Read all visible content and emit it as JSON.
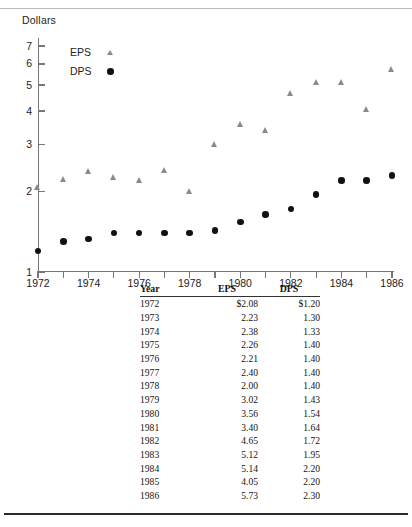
{
  "chart_data": {
    "type": "scatter",
    "title": "",
    "ylabel": "Dollars",
    "xlabel": "",
    "yscale": "log",
    "ylim": [
      1,
      7.5
    ],
    "xlim": [
      1972,
      1986
    ],
    "grid": false,
    "legend_position": "upper-left",
    "y_ticks": [
      1,
      2,
      3,
      4,
      5,
      6,
      7
    ],
    "y_tick_labels": [
      "1",
      "2",
      "3",
      "4",
      "5",
      "6",
      "7"
    ],
    "x_ticks": [
      1972,
      1973,
      1974,
      1975,
      1976,
      1977,
      1978,
      1979,
      1980,
      1981,
      1982,
      1983,
      1984,
      1985,
      1986
    ],
    "x_tick_labels": [
      "1972",
      "",
      "1974",
      "",
      "1976",
      "",
      "1978",
      "",
      "1980",
      "",
      "1982",
      "",
      "1984",
      "",
      "1986"
    ],
    "x": [
      1972,
      1973,
      1974,
      1975,
      1976,
      1977,
      1978,
      1979,
      1980,
      1981,
      1982,
      1983,
      1984,
      1985,
      1986
    ],
    "series": [
      {
        "name": "EPS",
        "marker": "triangle",
        "color": "#8a8a8a",
        "values": [
          2.08,
          2.23,
          2.38,
          2.26,
          2.21,
          2.4,
          2.0,
          3.02,
          3.56,
          3.4,
          4.65,
          5.12,
          5.14,
          4.05,
          5.73
        ]
      },
      {
        "name": "DPS",
        "marker": "circle",
        "color": "#111111",
        "values": [
          1.2,
          1.3,
          1.33,
          1.4,
          1.4,
          1.4,
          1.4,
          1.43,
          1.54,
          1.64,
          1.72,
          1.95,
          2.2,
          2.2,
          2.3
        ]
      }
    ]
  },
  "legend": {
    "items": [
      {
        "label": "EPS",
        "marker": "triangle"
      },
      {
        "label": "DPS",
        "marker": "circle"
      }
    ]
  },
  "table": {
    "headers": [
      "Year",
      "EPS",
      "DPS"
    ],
    "rows": [
      [
        "1972",
        "$2.08",
        "$1.20"
      ],
      [
        "1973",
        "2.23",
        "1.30"
      ],
      [
        "1974",
        "2.38",
        "1.33"
      ],
      [
        "1975",
        "2.26",
        "1.40"
      ],
      [
        "1976",
        "2.21",
        "1.40"
      ],
      [
        "1977",
        "2.40",
        "1.40"
      ],
      [
        "1978",
        "2.00",
        "1.40"
      ],
      [
        "1979",
        "3.02",
        "1.43"
      ],
      [
        "1980",
        "3.56",
        "1.54"
      ],
      [
        "1981",
        "3.40",
        "1.64"
      ],
      [
        "1982",
        "4.65",
        "1.72"
      ],
      [
        "1983",
        "5.12",
        "1.95"
      ],
      [
        "1984",
        "5.14",
        "2.20"
      ],
      [
        "1985",
        "4.05",
        "2.20"
      ],
      [
        "1986",
        "5.73",
        "2.30"
      ]
    ]
  }
}
